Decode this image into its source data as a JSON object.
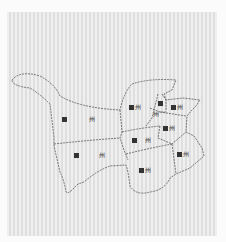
{
  "map": {
    "background_color": "#e6e6e6",
    "border_color": "#555555",
    "border_style": "dashed",
    "regions": [
      {
        "id": "west-north",
        "suffix": "州",
        "x": 62,
        "y": 116,
        "gap": 20
      },
      {
        "id": "west-south",
        "suffix": "州",
        "x": 74,
        "y": 152,
        "gap": 18
      },
      {
        "id": "center-north",
        "suffix": "州",
        "x": 129,
        "y": 104,
        "gap": 3
      },
      {
        "id": "center-mid",
        "suffix": "州",
        "x": 132,
        "y": 137,
        "gap": 8
      },
      {
        "id": "center-south",
        "suffix": "州",
        "x": 139,
        "y": 167,
        "gap": 2
      },
      {
        "id": "ne-small-1",
        "suffix": "州",
        "x": 158,
        "y": 101,
        "gap": 1
      },
      {
        "id": "ne-small-2",
        "suffix": "州",
        "x": 172,
        "y": 104,
        "gap": 2
      },
      {
        "id": "ne-small-3",
        "suffix": "州",
        "x": 154,
        "y": 111,
        "gap": 1
      },
      {
        "id": "east-mid",
        "suffix": "州",
        "x": 163,
        "y": 125,
        "gap": 2
      },
      {
        "id": "east-south",
        "suffix": "州",
        "x": 177,
        "y": 151,
        "gap": 2
      }
    ]
  }
}
